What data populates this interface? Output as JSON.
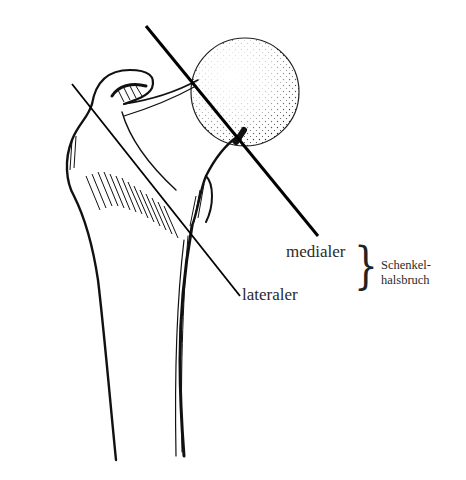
{
  "figure": {
    "lines": [
      {
        "id": "medial-fracture-line",
        "x1": 146,
        "y1": 26,
        "x2": 318,
        "y2": 236
      },
      {
        "id": "lateral-fracture-line",
        "x1": 72,
        "y1": 84,
        "x2": 240,
        "y2": 296
      }
    ],
    "colors": {
      "ink": "#111111",
      "background": "#ffffff",
      "label": "#2a2a2a"
    }
  },
  "labels": {
    "medial": "medialer",
    "lateral": "lateraler",
    "group_line1": "Schenkel-",
    "group_line2": "halsbruch",
    "brace": "}"
  }
}
